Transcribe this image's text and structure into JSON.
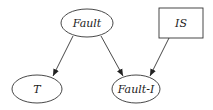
{
  "diagram": {
    "type": "bayesian-network",
    "nodes": [
      {
        "id": "fault",
        "label": "Fault",
        "shape": "ellipse",
        "cx": 87,
        "cy": 23,
        "rx": 27,
        "ry": 14
      },
      {
        "id": "is",
        "label": "IS",
        "shape": "rectangle",
        "x": 159,
        "y": 8,
        "w": 44,
        "h": 30
      },
      {
        "id": "t",
        "label": "T",
        "shape": "ellipse",
        "cx": 37,
        "cy": 89,
        "rx": 25,
        "ry": 14
      },
      {
        "id": "fault_i",
        "label": "Fault-I",
        "shape": "ellipse",
        "cx": 136,
        "cy": 89,
        "rx": 24,
        "ry": 14
      }
    ],
    "edges": [
      {
        "from": "Fault",
        "to": "T"
      },
      {
        "from": "Fault",
        "to": "Fault-I"
      },
      {
        "from": "IS",
        "to": "Fault-I"
      }
    ],
    "colors": {
      "stroke": "#333333",
      "text": "#222222",
      "background": "#ffffff"
    }
  }
}
